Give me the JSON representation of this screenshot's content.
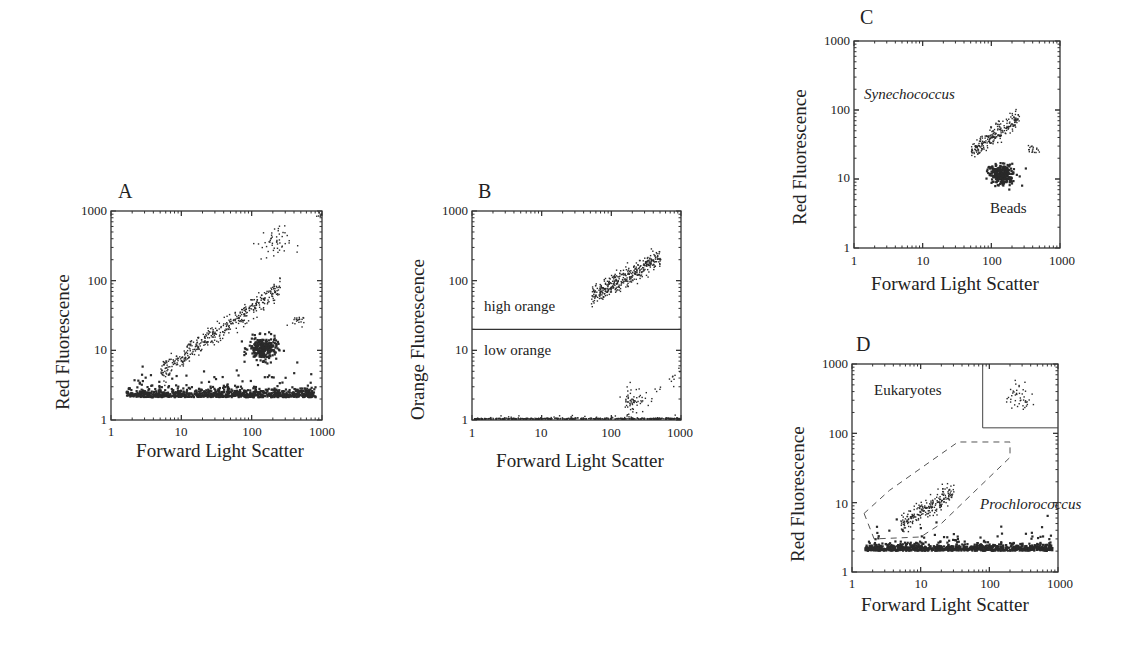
{
  "figure": {
    "panels": [
      {
        "id": "A",
        "letter": "A",
        "xlabel": "Forward Light Scatter",
        "ylabel": "Red Fluorescence"
      },
      {
        "id": "B",
        "letter": "B",
        "xlabel": "Forward Light Scatter",
        "ylabel": "Orange Fluorescence"
      },
      {
        "id": "C",
        "letter": "C",
        "xlabel": "Forward Light Scatter",
        "ylabel": "Red Fluorescence"
      },
      {
        "id": "D",
        "letter": "D",
        "xlabel": "Forward Light Scatter",
        "ylabel": "Red Fluorescence"
      }
    ],
    "tick_labels": [
      "1",
      "10",
      "100",
      "1000"
    ],
    "annotations": {
      "B_high": "high orange",
      "B_low": "low orange",
      "C_syn": "Synechococcus",
      "C_beads": "Beads",
      "D_euk": "Eukaryotes",
      "D_pro": "Prochlorococcus"
    }
  },
  "chart_data": [
    {
      "panel": "A",
      "type": "scatter",
      "title": "A",
      "xlabel": "Forward Light Scatter",
      "ylabel": "Red Fluorescence",
      "xscale": "log",
      "yscale": "log",
      "xlim": [
        1,
        1000
      ],
      "ylim": [
        1,
        1000
      ],
      "xticks": [
        1,
        10,
        100,
        1000
      ],
      "yticks": [
        1,
        10,
        100,
        1000
      ],
      "clusters": [
        {
          "name": "noise band",
          "x_range": [
            1.6,
            800
          ],
          "y_center": 2.2,
          "y_spread": 0.15,
          "n": 900,
          "density": "dense"
        },
        {
          "name": "diagonal population",
          "x_range": [
            5,
            250
          ],
          "y_from": 5,
          "y_to": 80,
          "n": 420
        },
        {
          "name": "beads",
          "x_center": 140,
          "y_center": 11,
          "x_spread": 0.1,
          "y_spread": 0.08,
          "n": 260,
          "density": "dense"
        },
        {
          "name": "small cluster",
          "x_center": 420,
          "y_center": 27,
          "x_spread": 0.05,
          "y_spread": 0.04,
          "n": 20
        },
        {
          "name": "upper population",
          "x_center": 200,
          "y_center": 350,
          "x_spread": 0.12,
          "y_spread": 0.12,
          "n": 50
        },
        {
          "name": "corner",
          "x_center": 900,
          "y_center": 900,
          "x_spread": 0.02,
          "y_spread": 0.02,
          "n": 8
        }
      ]
    },
    {
      "panel": "B",
      "type": "scatter",
      "title": "B",
      "xlabel": "Forward Light Scatter",
      "ylabel": "Orange Fluorescence",
      "xscale": "log",
      "yscale": "log",
      "xlim": [
        1,
        1000
      ],
      "ylim": [
        1,
        1000
      ],
      "xticks": [
        1,
        10,
        100,
        1000
      ],
      "yticks": [
        1,
        10,
        100,
        1000
      ],
      "gate_line_y": 20,
      "regions": [
        "high orange",
        "low orange"
      ],
      "clusters": [
        {
          "name": "high orange population",
          "x_range": [
            50,
            500
          ],
          "y_from": 60,
          "y_to": 220,
          "n": 380
        },
        {
          "name": "low orange population",
          "x_center": 200,
          "y_center": 2,
          "x_spread": 0.08,
          "y_spread": 0.1,
          "n": 60
        },
        {
          "name": "low orange tail",
          "x_range": [
            350,
            950
          ],
          "y_from": 2.5,
          "y_to": 4.5,
          "n": 15
        },
        {
          "name": "baseline",
          "x_range": [
            1,
            1000
          ],
          "y_center": 1.05,
          "y_spread": 0.02,
          "n": 400
        }
      ]
    },
    {
      "panel": "C",
      "type": "scatter",
      "title": "C",
      "xlabel": "Forward Light Scatter",
      "ylabel": "Red Fluorescence",
      "xscale": "log",
      "yscale": "log",
      "xlim": [
        1,
        1000
      ],
      "ylim": [
        1,
        1000
      ],
      "xticks": [
        1,
        10,
        100,
        1000
      ],
      "yticks": [
        1,
        10,
        100,
        1000
      ],
      "labels": [
        "Synechococcus",
        "Beads"
      ],
      "clusters": [
        {
          "name": "Synechococcus",
          "x_range": [
            50,
            250
          ],
          "y_from": 25,
          "y_to": 80,
          "n": 230
        },
        {
          "name": "Beads",
          "x_center": 140,
          "y_center": 12,
          "x_spread": 0.09,
          "y_spread": 0.07,
          "n": 280,
          "density": "dense"
        },
        {
          "name": "small cluster",
          "x_center": 420,
          "y_center": 27,
          "x_spread": 0.05,
          "y_spread": 0.03,
          "n": 18
        }
      ]
    },
    {
      "panel": "D",
      "type": "scatter",
      "title": "D",
      "xlabel": "Forward Light Scatter",
      "ylabel": "Red Fluorescence",
      "xscale": "log",
      "yscale": "log",
      "xlim": [
        1,
        1000
      ],
      "ylim": [
        1,
        1000
      ],
      "xticks": [
        1,
        10,
        100,
        1000
      ],
      "yticks": [
        1,
        10,
        100,
        1000
      ],
      "labels": [
        "Eukaryotes",
        "Prochlorococcus"
      ],
      "gates": {
        "eukaryotes_box": {
          "x": [
            80,
            1000
          ],
          "y": [
            120,
            1000
          ]
        },
        "prochlorococcus_polygon": [
          [
            1.5,
            7
          ],
          [
            2.1,
            3
          ],
          [
            10,
            3.2
          ],
          [
            20,
            5
          ],
          [
            200,
            45
          ],
          [
            200,
            75
          ],
          [
            35,
            75
          ],
          [
            3.5,
            15
          ]
        ]
      },
      "clusters": [
        {
          "name": "noise band",
          "x_range": [
            1.5,
            800
          ],
          "y_center": 2.1,
          "y_spread": 0.12,
          "n": 900,
          "density": "dense"
        },
        {
          "name": "Prochlorococcus",
          "x_range": [
            5,
            30
          ],
          "y_from": 5,
          "y_to": 15,
          "n": 220
        },
        {
          "name": "Eukaryotes",
          "x_center": 270,
          "y_center": 320,
          "x_spread": 0.1,
          "y_spread": 0.1,
          "n": 45
        }
      ]
    }
  ]
}
